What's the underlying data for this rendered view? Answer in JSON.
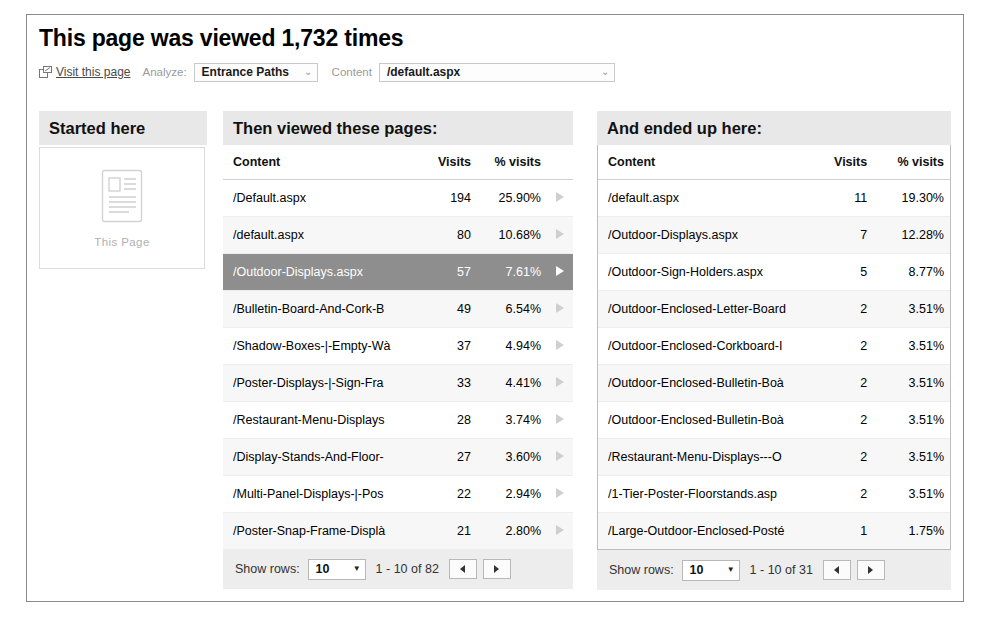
{
  "header": {
    "title": "This page was viewed 1,732 times",
    "visit_link_label": "Visit this page",
    "visit_link_icon": "external-link-icon",
    "analyze_label": "Analyze:",
    "analyze_value": "Entrance Paths",
    "content_label": "Content",
    "content_value": "/default.aspx",
    "caret_glyph": "⌄"
  },
  "started": {
    "heading": "Started here",
    "icon": "page-document-icon",
    "caption": "This Page"
  },
  "then": {
    "heading": "Then viewed these pages:",
    "columns": [
      "Content",
      "Visits",
      "% visits"
    ],
    "rows": [
      {
        "content": "/Default.aspx",
        "visits": "194",
        "pct": "25.90%",
        "selected": false
      },
      {
        "content": "/default.aspx",
        "visits": "80",
        "pct": "10.68%",
        "selected": false
      },
      {
        "content": "/Outdoor-Displays.aspx",
        "visits": "57",
        "pct": "7.61%",
        "selected": true
      },
      {
        "content": "/Bulletin-Board-And-Cork-B",
        "visits": "49",
        "pct": "6.54%",
        "selected": false
      },
      {
        "content": "/Shadow-Boxes-|-Empty-Wà",
        "visits": "37",
        "pct": "4.94%",
        "selected": false
      },
      {
        "content": "/Poster-Displays-|-Sign-Fra",
        "visits": "33",
        "pct": "4.41%",
        "selected": false
      },
      {
        "content": "/Restaurant-Menu-Displays",
        "visits": "28",
        "pct": "3.74%",
        "selected": false
      },
      {
        "content": "/Display-Stands-And-Floor-",
        "visits": "27",
        "pct": "3.60%",
        "selected": false
      },
      {
        "content": "/Multi-Panel-Displays-|-Pos",
        "visits": "22",
        "pct": "2.94%",
        "selected": false
      },
      {
        "content": "/Poster-Snap-Frame-Displà",
        "visits": "21",
        "pct": "2.80%",
        "selected": false
      }
    ],
    "pager": {
      "label": "Show rows:",
      "rows_value": "10",
      "range": "1 - 10 of 82",
      "prev_icon": "chevron-left-icon",
      "next_icon": "chevron-right-icon"
    }
  },
  "ended": {
    "heading": "And ended up here:",
    "columns": [
      "Content",
      "Visits",
      "% visits"
    ],
    "rows": [
      {
        "content": "/default.aspx",
        "visits": "11",
        "pct": "19.30%"
      },
      {
        "content": "/Outdoor-Displays.aspx",
        "visits": "7",
        "pct": "12.28%"
      },
      {
        "content": "/Outdoor-Sign-Holders.aspx",
        "visits": "5",
        "pct": "8.77%"
      },
      {
        "content": "/Outdoor-Enclosed-Letter-Board",
        "visits": "2",
        "pct": "3.51%"
      },
      {
        "content": "/Outdoor-Enclosed-Corkboard-I",
        "visits": "2",
        "pct": "3.51%"
      },
      {
        "content": "/Outdoor-Enclosed-Bulletin-Boà",
        "visits": "2",
        "pct": "3.51%"
      },
      {
        "content": "/Outdoor-Enclosed-Bulletin-Boà",
        "visits": "2",
        "pct": "3.51%"
      },
      {
        "content": "/Restaurant-Menu-Displays---O",
        "visits": "2",
        "pct": "3.51%"
      },
      {
        "content": "/1-Tier-Poster-Floorstands.asp",
        "visits": "2",
        "pct": "3.51%"
      },
      {
        "content": "/Large-Outdoor-Enclosed-Posté",
        "visits": "1",
        "pct": "1.75%"
      }
    ],
    "pager": {
      "label": "Show rows:",
      "rows_value": "10",
      "range": "1 - 10 of 31",
      "prev_icon": "chevron-left-icon",
      "next_icon": "chevron-right-icon"
    }
  },
  "colors": {
    "header_bar": "#e8e8e8",
    "selected_row": "#8e8e8e",
    "pager_bar": "#ededed",
    "frame_border": "#8a8a8a",
    "muted_text": "#9a9a9a"
  }
}
